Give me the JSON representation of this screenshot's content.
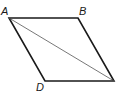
{
  "figure": {
    "type": "parallelogram",
    "labels": {
      "A": "A",
      "B": "B",
      "D": "D"
    },
    "stroke_color": "#1a1a1a",
    "diagonal": "A-C"
  }
}
